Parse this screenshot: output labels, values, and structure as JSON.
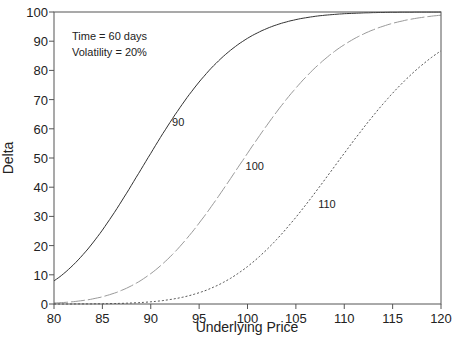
{
  "chart_data": {
    "type": "line",
    "title": "",
    "xlabel": "Underlying Price",
    "ylabel": "Delta",
    "xlim": [
      80,
      120
    ],
    "ylim": [
      0,
      100
    ],
    "xticks": [
      80,
      85,
      90,
      95,
      100,
      105,
      110,
      115,
      120
    ],
    "yticks": [
      0,
      10,
      20,
      30,
      40,
      50,
      60,
      70,
      80,
      90,
      100
    ],
    "grid": false,
    "legend": "none (curves labeled inline)",
    "annotations": [
      "Time = 60 days",
      "Volatility = 20%"
    ],
    "params": {
      "time_days": 60,
      "volatility": 0.2
    },
    "x": [
      80,
      85,
      90,
      95,
      100,
      105,
      110,
      115,
      120
    ],
    "series": [
      {
        "name": "90",
        "style": "solid",
        "color": "#333333",
        "values": [
          7.9,
          25.2,
          51.6,
          77.2,
          91.0,
          97.5,
          99.4,
          99.9,
          100.0
        ]
      },
      {
        "name": "100",
        "style": "dashed",
        "color": "#9a9a9a",
        "values": [
          0.3,
          2.6,
          10.4,
          28.1,
          51.6,
          73.5,
          88.8,
          96.2,
          98.9
        ]
      },
      {
        "name": "110",
        "style": "dotted",
        "color": "#555555",
        "values": [
          0.0,
          0.1,
          0.6,
          3.5,
          12.1,
          28.7,
          51.6,
          72.6,
          86.7
        ]
      }
    ],
    "curve_labels": [
      {
        "text": "90",
        "x": 92.2,
        "y": 61
      },
      {
        "text": "100",
        "x": 99.8,
        "y": 46
      },
      {
        "text": "110",
        "x": 107.3,
        "y": 33
      }
    ]
  }
}
